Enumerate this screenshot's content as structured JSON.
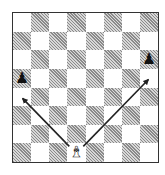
{
  "diagram": {
    "type": "chess-board",
    "files": [
      "a",
      "b",
      "c",
      "d",
      "e",
      "f",
      "g",
      "h"
    ],
    "ranks": [
      8,
      7,
      6,
      5,
      4,
      3,
      2,
      1
    ],
    "colors": {
      "light_square": "#ffffff",
      "dark_square": "#bdbdbd",
      "border": "#333333",
      "arrow": "#222222"
    },
    "pieces": [
      {
        "square": "a5",
        "color": "black",
        "type": "pawn",
        "glyph": "♟",
        "icon": "black-pawn-icon"
      },
      {
        "square": "h6",
        "color": "black",
        "type": "pawn",
        "glyph": "♟",
        "icon": "black-pawn-icon"
      },
      {
        "square": "d1",
        "color": "white",
        "type": "bishop",
        "glyph": "♝",
        "icon": "white-bishop-icon"
      }
    ],
    "arrows": [
      {
        "from": "d1",
        "to": "a4",
        "direction": "up-left"
      },
      {
        "from": "d1",
        "to": "h5",
        "direction": "up-right"
      }
    ]
  }
}
